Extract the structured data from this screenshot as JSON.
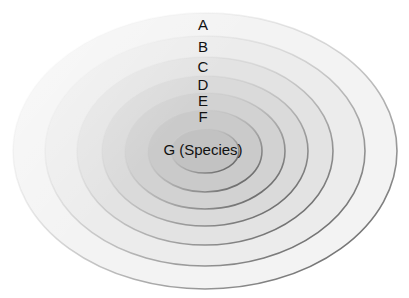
{
  "diagram": {
    "type": "nested-ellipses",
    "center": {
      "x": 205,
      "y": 151
    },
    "levels": [
      {
        "label": "A",
        "rx": 192,
        "ry": 138,
        "label_y": 25,
        "fill": "#f3f3f3"
      },
      {
        "label": "B",
        "rx": 160,
        "ry": 115,
        "label_y": 47,
        "fill": "#ececec"
      },
      {
        "label": "C",
        "rx": 128,
        "ry": 94,
        "label_y": 67,
        "fill": "#e3e3e3"
      },
      {
        "label": "D",
        "rx": 103,
        "ry": 75,
        "label_y": 85,
        "fill": "#dadada"
      },
      {
        "label": "E",
        "rx": 80,
        "ry": 58,
        "label_y": 101,
        "fill": "#d2d2d2"
      },
      {
        "label": "F",
        "rx": 57,
        "ry": 41,
        "label_y": 117,
        "fill": "#cacaca"
      },
      {
        "label": "G (Species)",
        "rx": 34,
        "ry": 22,
        "label_y": 150,
        "fill": "#c2c2c2"
      }
    ],
    "stroke_color": "#555555"
  }
}
